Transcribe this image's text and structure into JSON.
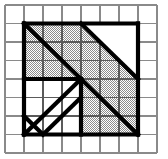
{
  "figure": {
    "type": "geometric-grid-diagram",
    "canvas": {
      "width": 168,
      "height": 159,
      "background": "#ffffff"
    },
    "grid": {
      "name": "background-square-grid",
      "columns": 8,
      "rows": 8,
      "x0": 5,
      "y0": 5,
      "x1": 157,
      "y1": 153,
      "cell_width": 19,
      "cell_height": 18.5,
      "line_color": "#8a8a8a",
      "line_width": 1.1,
      "visible": true
    },
    "bold_shape": {
      "name": "bold-outlined-figure",
      "stroke_color": "#000000",
      "stroke_width": 4.2,
      "fill_hatch_color": "#9a9a9a",
      "fill_hatch_background": "#ffffff",
      "bounds_cells": {
        "col_start": 1,
        "row_start": 1,
        "col_end": 7,
        "row_end": 7
      },
      "bounds_px": {
        "x": 24,
        "y": 23.5,
        "width": 114,
        "height": 111
      }
    },
    "shaded_regions": [
      {
        "name": "upper-left-triangle-shaded",
        "description": "Triangle below the main diagonal in the upper-left quadrant",
        "points_cells": [
          [
            1,
            1
          ],
          [
            1,
            7
          ],
          [
            7,
            7
          ]
        ]
      },
      {
        "name": "upper-right-band-shaded",
        "description": "Band between main diagonal and secondary diagonal, upper right",
        "points_cells": [
          [
            4,
            1
          ],
          [
            7,
            4
          ],
          [
            7,
            7
          ],
          [
            1,
            1
          ]
        ]
      },
      {
        "name": "lower-right-block-shaded",
        "description": "Shaded block right of the vertical divider, below row 4",
        "points_cells": [
          [
            4,
            4
          ],
          [
            7,
            4
          ],
          [
            7,
            7
          ],
          [
            4,
            7
          ]
        ]
      }
    ],
    "white_regions": [
      {
        "name": "upper-right-corner-white",
        "description": "White triangle above the secondary diagonal",
        "points_cells": [
          [
            4,
            1
          ],
          [
            7,
            1
          ],
          [
            7,
            4
          ]
        ]
      },
      {
        "name": "lower-left-square-white",
        "description": "White 3x3 square in the lower-left containing two parallel diagonals",
        "points_cells": [
          [
            1,
            4
          ],
          [
            4,
            4
          ],
          [
            4,
            7
          ],
          [
            1,
            7
          ]
        ]
      }
    ],
    "bold_lines": [
      {
        "name": "outer-top-edge",
        "from_cell": [
          1,
          1
        ],
        "to_cell": [
          7,
          1
        ]
      },
      {
        "name": "outer-left-edge",
        "from_cell": [
          1,
          1
        ],
        "to_cell": [
          1,
          7
        ]
      },
      {
        "name": "outer-right-edge",
        "from_cell": [
          7,
          1
        ],
        "to_cell": [
          7,
          7
        ]
      },
      {
        "name": "outer-bottom-edge",
        "from_cell": [
          1,
          7
        ],
        "to_cell": [
          7,
          7
        ]
      },
      {
        "name": "main-diagonal",
        "from_cell": [
          1,
          1
        ],
        "to_cell": [
          7,
          7
        ]
      },
      {
        "name": "secondary-diagonal",
        "from_cell": [
          4,
          1
        ],
        "to_cell": [
          7,
          4
        ]
      },
      {
        "name": "mid-horizontal-divider",
        "from_cell": [
          1,
          4
        ],
        "to_cell": [
          4,
          4
        ]
      },
      {
        "name": "mid-vertical-divider",
        "from_cell": [
          4,
          4
        ],
        "to_cell": [
          4,
          7
        ]
      },
      {
        "name": "inner-anti-diagonal-long",
        "from_cell": [
          1,
          7
        ],
        "to_cell": [
          4,
          4
        ]
      },
      {
        "name": "inner-anti-diagonal-short",
        "from_cell": [
          1,
          6
        ],
        "to_cell": [
          2,
          7
        ]
      },
      {
        "name": "inner-anti-diagonal-mid",
        "from_cell": [
          2,
          7
        ],
        "to_cell": [
          4,
          5
        ]
      }
    ]
  }
}
